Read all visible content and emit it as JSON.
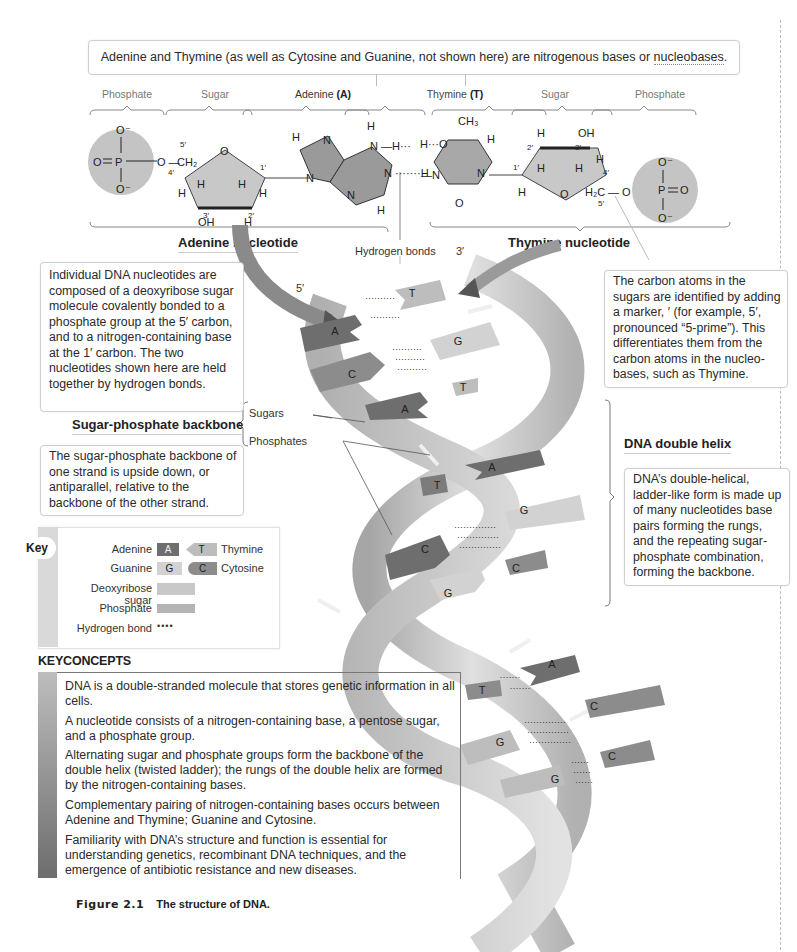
{
  "figure": {
    "number": "Figure 2.1",
    "caption": "The structure of DNA."
  },
  "top_callout": {
    "text_before": "Adenine and Thymine (as well as Cytosine and Guanine, not shown here) are nitrogenous bases or ",
    "linked_term": "nucleobases",
    "text_after": "."
  },
  "component_labels": [
    {
      "id": "phosphate-left",
      "label": "Phosphate"
    },
    {
      "id": "sugar-left",
      "label": "Sugar"
    },
    {
      "id": "adenine",
      "label": "Adenine",
      "suffix": "(A)"
    },
    {
      "id": "thymine",
      "label": "Thymine",
      "suffix": "(T)"
    },
    {
      "id": "sugar-right",
      "label": "Sugar"
    },
    {
      "id": "phosphate-right",
      "label": "Phosphate"
    }
  ],
  "chemistry": {
    "phosphate": {
      "P": "P",
      "O": "O",
      "O_minus": "O⁻"
    },
    "left_sugar": {
      "ch2": "CH₂",
      "o_ring": "O",
      "oh": "OH",
      "H": "H",
      "primes": [
        "5′",
        "4′",
        "3′",
        "2′",
        "1′"
      ]
    },
    "right_sugar": {
      "ch2": "H₂C",
      "o_ring": "O",
      "oh": "OH",
      "H": "H",
      "primes": [
        "1′",
        "2′",
        "3′",
        "4′",
        "5′"
      ]
    },
    "adenine_atoms": {
      "N": "N",
      "H": "H"
    },
    "thymine_atoms": {
      "ch3": "CH₃",
      "N": "N",
      "O": "O",
      "H": "H"
    }
  },
  "nucleotide_labels": {
    "adenine_nucleotide": "Adenine nucleotide",
    "thymine_nucleotide": "Thymine nucleotide",
    "hydrogen_bonds": "Hydrogen bonds",
    "five_prime": "5′",
    "three_prime": "3′"
  },
  "callouts": {
    "nucleotides": "Individual DNA nucleotides are composed of a deoxyribose sugar molecule covalently bonded to a phosphate group at the 5′ carbon, and to a nitrogen-containing base at the 1′ carbon. The two nucleotides shown here are held together by hydrogen bonds.",
    "carbon_atoms": "The carbon atoms in the sugars are identified by adding a marker, ′ (for example, 5′, pronounced “5-prime”). This differentiates them from the carbon atoms in the nucleo-bases, such as Thymine.",
    "backbone": "The sugar-phosphate backbone of one strand is upside down, or antiparallel, relative to the backbone of the other strand.",
    "double_helix": "DNA’s double-helical, ladder-like form is made up of many nucleotides base pairs forming the rungs, and the repeating sugar-phosphate combination, forming the backbone."
  },
  "section_titles": {
    "backbone": "Sugar-phosphate backbone",
    "double_helix": "DNA double helix"
  },
  "backbone_labels": {
    "sugars": "Sugars",
    "phosphates": "Phosphates"
  },
  "helix_base_pairs": [
    {
      "left": "A",
      "right": "T",
      "bonds": 2
    },
    {
      "left": "C",
      "right": "G",
      "bonds": 3
    },
    {
      "left": "A",
      "right": "T",
      "bonds": 2
    },
    {
      "left": "T",
      "right": "A",
      "bonds": 2
    },
    {
      "left": "C",
      "right": "G",
      "bonds": 3
    },
    {
      "left": "G",
      "right": "C",
      "bonds": 3
    },
    {
      "left": "T",
      "right": "A",
      "bonds": 2
    },
    {
      "left": "G",
      "right": "C",
      "bonds": 3
    },
    {
      "left": "G",
      "right": "C",
      "bonds": 3
    }
  ],
  "key": {
    "title": "Key",
    "rows": [
      {
        "left_label": "Adenine",
        "left_chip": "A",
        "right_chip": "T",
        "right_label": "Thymine"
      },
      {
        "left_label": "Guanine",
        "left_chip": "G",
        "right_chip": "C",
        "right_label": "Cytosine"
      },
      {
        "left_label": "Deoxyribose sugar"
      },
      {
        "left_label": "Phosphate"
      },
      {
        "left_label": "Hydrogen bond",
        "symbol": "••••"
      }
    ]
  },
  "key_concepts": {
    "title": "KEYCONCEPTS",
    "items": [
      "DNA is a double-stranded molecule that stores genetic information in all cells.",
      "A nucleotide consists of a nitrogen-containing base, a pentose sugar, and a phosphate group.",
      "Alternating sugar and phosphate groups form the backbone of the double helix (twisted ladder); the rungs of the double helix are formed by the nitrogen-containing bases.",
      "Complementary pairing of nitrogen-containing bases occurs between Adenine and Thymine; Guanine and Cytosine.",
      "Familiarity with DNA’s structure and function is essential for understanding genetics, recombinant DNA techniques, and the emergence of antibiotic resistance and new diseases."
    ]
  },
  "colors": {
    "adenine": "#6e6e6e",
    "thymine": "#bdbdbd",
    "guanine": "#d2d2d2",
    "cytosine": "#8c8c8c",
    "sugar": "#c8c8c8",
    "phosphate": "#b4b4b4",
    "backbone_ribbon": "#d0d0d0"
  }
}
